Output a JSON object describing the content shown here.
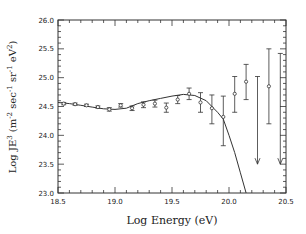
{
  "chart_data": {
    "type": "scatter",
    "title": "",
    "xlabel": "Log Energy (eV)",
    "ylabel": "Log JE³ (m⁻² sec⁻¹ sr⁻¹ eV²)",
    "ylabel_parts": {
      "base": "Log JE",
      "sup1": "3",
      "mid1": " (m",
      "sup2": "-2",
      "mid2": " sec",
      "sup3": "-1",
      "mid3": " sr",
      "sup4": "-1",
      "mid4": " eV",
      "sup5": "2",
      "end": ")"
    },
    "xlim": [
      18.5,
      20.5
    ],
    "ylim": [
      23.0,
      26.0
    ],
    "x_ticks": [
      "18.5",
      "19.0",
      "19.5",
      "20.0",
      "20.5"
    ],
    "y_ticks": [
      "23.0",
      "23.5",
      "24.0",
      "24.5",
      "25.0",
      "25.5",
      "26.0"
    ],
    "grid": false,
    "legend": null,
    "series": [
      {
        "name": "measurements",
        "points": [
          {
            "x": 18.55,
            "y": 24.55,
            "lo": 24.53,
            "hi": 24.57
          },
          {
            "x": 18.65,
            "y": 24.54,
            "lo": 24.52,
            "hi": 24.56
          },
          {
            "x": 18.75,
            "y": 24.52,
            "lo": 24.5,
            "hi": 24.54
          },
          {
            "x": 18.85,
            "y": 24.49,
            "lo": 24.47,
            "hi": 24.51
          },
          {
            "x": 18.95,
            "y": 24.45,
            "lo": 24.42,
            "hi": 24.48
          },
          {
            "x": 19.05,
            "y": 24.52,
            "lo": 24.49,
            "hi": 24.55
          },
          {
            "x": 19.15,
            "y": 24.47,
            "lo": 24.43,
            "hi": 24.51
          },
          {
            "x": 19.25,
            "y": 24.53,
            "lo": 24.48,
            "hi": 24.58
          },
          {
            "x": 19.35,
            "y": 24.55,
            "lo": 24.49,
            "hi": 24.61
          },
          {
            "x": 19.45,
            "y": 24.48,
            "lo": 24.4,
            "hi": 24.56
          },
          {
            "x": 19.55,
            "y": 24.62,
            "lo": 24.55,
            "hi": 24.69
          },
          {
            "x": 19.65,
            "y": 24.72,
            "lo": 24.62,
            "hi": 24.82
          },
          {
            "x": 19.75,
            "y": 24.57,
            "lo": 24.4,
            "hi": 24.74
          },
          {
            "x": 19.85,
            "y": 24.47,
            "lo": 24.2,
            "hi": 24.7
          },
          {
            "x": 19.95,
            "y": 24.32,
            "lo": 23.82,
            "hi": 24.68
          },
          {
            "x": 20.05,
            "y": 24.72,
            "lo": 24.4,
            "hi": 25.02
          },
          {
            "x": 20.15,
            "y": 24.93,
            "lo": 24.62,
            "hi": 25.23
          },
          {
            "x": 20.35,
            "y": 24.85,
            "lo": 24.2,
            "hi": 25.5
          }
        ]
      },
      {
        "name": "upper_limits",
        "points": [
          {
            "x": 20.25,
            "top": 25.02,
            "arrow_to": 23.5
          },
          {
            "x": 20.45,
            "top": 25.42,
            "arrow_to": 23.5
          }
        ]
      },
      {
        "name": "model_curve",
        "type": "line",
        "x": [
          18.5,
          18.6,
          18.7,
          18.8,
          18.9,
          19.0,
          19.1,
          19.2,
          19.3,
          19.4,
          19.5,
          19.6,
          19.7,
          19.8,
          19.85,
          19.9,
          19.95,
          20.0,
          20.05,
          20.1,
          20.15
        ],
        "y": [
          24.57,
          24.55,
          24.52,
          24.49,
          24.46,
          24.45,
          24.47,
          24.55,
          24.6,
          24.64,
          24.68,
          24.71,
          24.69,
          24.6,
          24.5,
          24.4,
          24.28,
          24.0,
          23.7,
          23.35,
          23.0
        ]
      }
    ]
  }
}
